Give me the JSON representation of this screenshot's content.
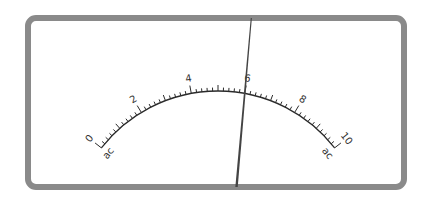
{
  "meter": {
    "type": "analog-dial-meter",
    "scale": {
      "min": 0,
      "max": 10,
      "major_labels": [
        "0",
        "2",
        "4",
        "6",
        "8",
        "10"
      ],
      "minor_step": 0.2,
      "start_unit_label": "ac",
      "end_unit_label": "ac"
    },
    "needle_value": 6.0,
    "colors": {
      "frame": "#8a8a8a",
      "face": "#ffffff",
      "scale": "#2a2a2a",
      "needle": "#444444"
    }
  }
}
